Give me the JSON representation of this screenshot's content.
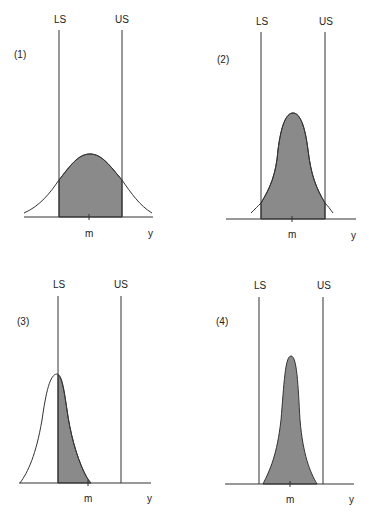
{
  "figure": {
    "panels": [
      {
        "id": "(1)",
        "lower_spec": "LS",
        "upper_spec": "US",
        "mean_label": "m",
        "axis_label": "y",
        "description": "Wide distribution, centered, tails exceed both limits"
      },
      {
        "id": "(2)",
        "lower_spec": "LS",
        "upper_spec": "US",
        "mean_label": "m",
        "axis_label": "y",
        "description": "Narrower distribution, centered, small tails outside limits"
      },
      {
        "id": "(3)",
        "lower_spec": "LS",
        "upper_spec": "US",
        "mean_label": "m",
        "axis_label": "y",
        "description": "Narrow distribution shifted low, peak at LS, large portion below LS"
      },
      {
        "id": "(4)",
        "lower_spec": "LS",
        "upper_spec": "US",
        "mean_label": "m",
        "axis_label": "y",
        "description": "Very narrow centered distribution fully within limits"
      }
    ],
    "colors": {
      "shade": "#8a8a8a",
      "line": "#333333",
      "background": "#ffffff"
    }
  }
}
